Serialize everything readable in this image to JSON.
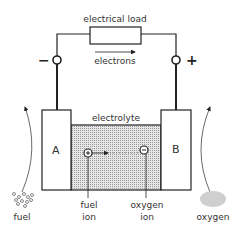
{
  "diagram": {
    "load_label": "electrical load",
    "electrons_label": "electrons",
    "negative_terminal": "−",
    "positive_terminal": "+",
    "electrolyte_label": "electrolyte",
    "electrode_a": "A",
    "electrode_b": "B",
    "fuel_ion_line1": "fuel",
    "fuel_ion_line2": "ion",
    "oxygen_ion_line1": "oxygen",
    "oxygen_ion_line2": "ion",
    "fuel_label": "fuel",
    "oxygen_label": "oxygen",
    "fuel_ion_symbol": "+",
    "oxygen_ion_symbol": "−"
  },
  "colors": {
    "line": "#222222",
    "electrolyte_fill": "#d9d9d9",
    "oxygen_cloud": "#cfcfcf"
  }
}
